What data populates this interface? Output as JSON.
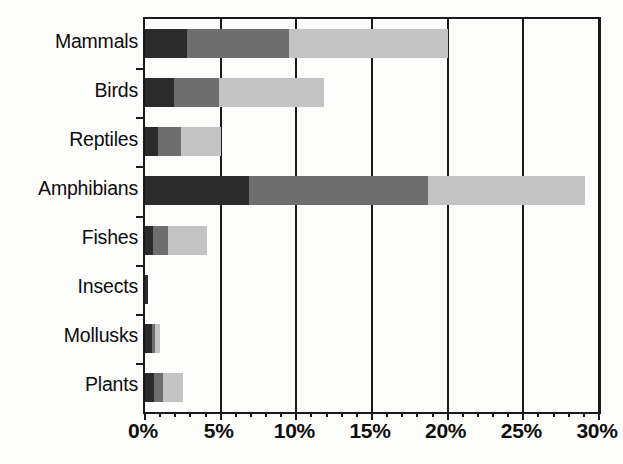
{
  "chart_data": {
    "type": "bar",
    "orientation": "horizontal",
    "stacked": true,
    "title": "",
    "subtitle": "",
    "xlabel": "",
    "ylabel": "",
    "xlim": [
      0,
      30
    ],
    "xtick_labels": [
      "0%",
      "5%",
      "10%",
      "15%",
      "20%",
      "25%",
      "30%"
    ],
    "xtick_values": [
      0,
      5,
      10,
      15,
      20,
      25,
      30
    ],
    "xtick_minor_step": 1,
    "grid": true,
    "grid_axis": "x",
    "legend": false,
    "legend_position": "none",
    "categories": [
      "Mammals",
      "Birds",
      "Reptiles",
      "Amphibians",
      "Fishes",
      "Insects",
      "Mollusks",
      "Plants"
    ],
    "series": [
      {
        "name": "segment-1",
        "color": "#2b2b2b",
        "values": [
          2.8,
          1.9,
          0.85,
          6.9,
          0.5,
          0.2,
          0.45,
          0.6
        ]
      },
      {
        "name": "segment-2",
        "color": "#6e6e6e",
        "values": [
          6.7,
          3.0,
          1.5,
          11.8,
          1.0,
          0.0,
          0.2,
          0.6
        ]
      },
      {
        "name": "segment-3",
        "color": "#c3c3c3",
        "values": [
          10.5,
          6.9,
          2.65,
          10.4,
          2.6,
          0.0,
          0.35,
          1.3
        ]
      }
    ],
    "totals": [
      20.0,
      11.8,
      5.0,
      29.1,
      4.1,
      0.2,
      1.0,
      2.5
    ]
  },
  "axis": {
    "x_axis_color": "#1a1a1a",
    "y_axis_color": "#1a1a1a",
    "background": "#fdfdfc"
  }
}
